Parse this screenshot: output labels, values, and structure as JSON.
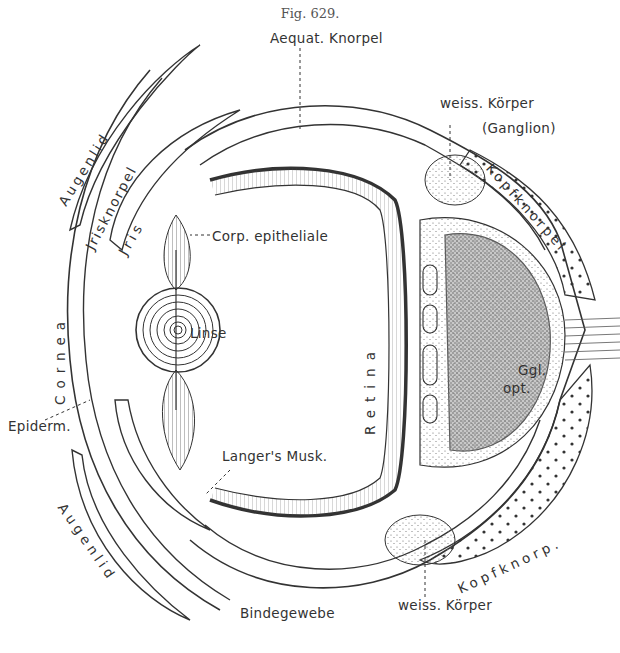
{
  "figure": {
    "caption": "Fig. 629.",
    "colors": {
      "ink": "#2a2a2a",
      "background": "#ffffff",
      "stipple": "#555555"
    }
  },
  "labels": {
    "aequat_knorpel": "Aequat. Knorpel",
    "weiss_koerper_top": "weiss. Körper",
    "ganglion": "(Ganglion)",
    "kopfknorpel": "Kopfknorpel",
    "augenlid_top": "Augenlid",
    "jrisknorpel": "Jrisknorpel",
    "jris": "Jris",
    "corp_epitheliale": "Corp. epitheliale",
    "linse": "Linse",
    "retina": "Retina",
    "cornea": "Cornea",
    "ggl": "Ggl.",
    "opt": "opt.",
    "epiderm": "Epiderm.",
    "langers_musk": "Langer's Musk.",
    "augenlid_bottom": "Augenlid",
    "kopfknorp": "Kopfknorp.",
    "bindegewebe": "Bindegewebe",
    "weiss_koerper_bottom": "weiss. Körper"
  }
}
